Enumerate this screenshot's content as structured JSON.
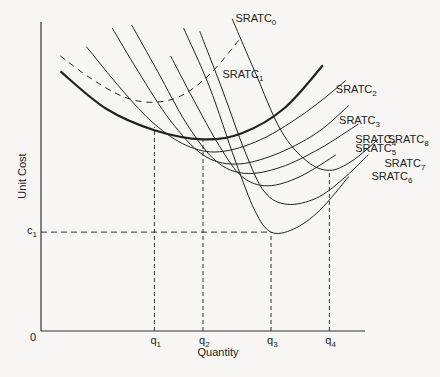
{
  "chart_data": {
    "type": "line",
    "title": "",
    "xlabel": "Quantity",
    "ylabel": "Unit Cost",
    "origin_label": "0",
    "xlim": [
      0,
      100
    ],
    "ylim": [
      0,
      100
    ],
    "x_ticks": [
      {
        "label": "q",
        "sub": "1",
        "value": 35
      },
      {
        "label": "q",
        "sub": "2",
        "value": 50
      },
      {
        "label": "q",
        "sub": "3",
        "value": 71
      },
      {
        "label": "q",
        "sub": "4",
        "value": 89
      }
    ],
    "y_ticks": [
      {
        "label": "c",
        "sub": "1",
        "value": 32
      }
    ],
    "series": [
      {
        "name": "SRATC",
        "sub": "0",
        "style": "dashed",
        "weight": "normal",
        "points": [
          [
            6,
            89
          ],
          [
            15,
            82
          ],
          [
            25,
            76
          ],
          [
            34,
            74
          ],
          [
            43,
            76
          ],
          [
            52,
            83
          ],
          [
            61,
            94
          ]
        ],
        "label_at": [
          60,
          100
        ]
      },
      {
        "name": "SRATC",
        "sub": "1",
        "style": "solid",
        "weight": "bold",
        "points": [
          [
            6,
            84
          ],
          [
            20,
            72
          ],
          [
            35,
            65
          ],
          [
            50,
            62
          ],
          [
            62,
            64
          ],
          [
            75,
            72
          ],
          [
            87,
            86
          ]
        ],
        "label_at": [
          56,
          82
        ]
      },
      {
        "name": "SRATC",
        "sub": "2",
        "style": "solid",
        "weight": "normal",
        "points": [
          [
            14,
            92
          ],
          [
            25,
            78
          ],
          [
            35,
            67
          ],
          [
            45,
            60
          ],
          [
            55,
            58
          ],
          [
            68,
            62
          ],
          [
            82,
            71
          ],
          [
            94,
            81
          ]
        ],
        "label_at": [
          91,
          77
        ]
      },
      {
        "name": "SRATC",
        "sub": "3",
        "style": "solid",
        "weight": "normal",
        "points": [
          [
            22,
            98
          ],
          [
            30,
            84
          ],
          [
            40,
            68
          ],
          [
            50,
            57
          ],
          [
            60,
            54
          ],
          [
            72,
            57
          ],
          [
            85,
            64
          ],
          [
            95,
            73
          ]
        ],
        "label_at": [
          92,
          67
        ]
      },
      {
        "name": "SRATC",
        "sub": "4",
        "style": "solid",
        "weight": "normal",
        "points": [
          [
            28,
            99
          ],
          [
            36,
            84
          ],
          [
            45,
            67
          ],
          [
            54,
            55
          ],
          [
            63,
            51
          ],
          [
            74,
            53
          ],
          [
            86,
            59
          ],
          [
            98,
            67
          ]
        ],
        "label_at": [
          97,
          61
        ]
      },
      {
        "name": "SRATC",
        "sub": "5",
        "style": "solid",
        "weight": "normal",
        "points": [
          [
            40,
            89
          ],
          [
            47,
            75
          ],
          [
            55,
            60
          ],
          [
            62,
            50
          ],
          [
            70,
            47
          ],
          [
            80,
            50
          ],
          [
            91,
            57
          ]
        ],
        "label_at": [
          97,
          58
        ]
      },
      {
        "name": "SRATC",
        "sub": "6",
        "style": "solid",
        "weight": "normal",
        "points": [
          [
            44,
            98
          ],
          [
            52,
            79
          ],
          [
            60,
            55
          ],
          [
            66,
            39
          ],
          [
            71,
            32
          ],
          [
            78,
            33
          ],
          [
            86,
            39
          ],
          [
            95,
            50
          ]
        ],
        "label_at": [
          102,
          49
        ]
      },
      {
        "name": "SRATC",
        "sub": "7",
        "style": "solid",
        "weight": "normal",
        "points": [
          [
            49,
            97
          ],
          [
            56,
            78
          ],
          [
            63,
            58
          ],
          [
            69,
            45
          ],
          [
            76,
            41
          ],
          [
            85,
            43
          ],
          [
            93,
            49
          ],
          [
            101,
            57
          ]
        ],
        "label_at": [
          106,
          53
        ]
      },
      {
        "name": "SRATC",
        "sub": "8",
        "style": "solid",
        "weight": "normal",
        "points": [
          [
            59,
            101
          ],
          [
            66,
            84
          ],
          [
            74,
            65
          ],
          [
            82,
            55
          ],
          [
            89,
            52
          ],
          [
            96,
            55
          ],
          [
            104,
            62
          ]
        ],
        "label_at": [
          107,
          61
        ]
      }
    ],
    "reference_lines": [
      {
        "type": "vertical",
        "x": 35,
        "y_to": 66
      },
      {
        "type": "vertical",
        "x": 50,
        "y_to": 62
      },
      {
        "type": "vertical",
        "x": 71,
        "y_to": 32
      },
      {
        "type": "vertical",
        "x": 89,
        "y_to": 52
      },
      {
        "type": "horizontal",
        "y": 32,
        "x_to": 71
      }
    ],
    "grid": false,
    "legend": "none"
  }
}
